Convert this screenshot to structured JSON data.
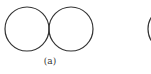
{
  "figure": {
    "panels": [
      {
        "label": "(a)",
        "label_pos": {
          "x": 50,
          "y": 57
        },
        "shapes": [
          {
            "type": "circle",
            "cx": 27,
            "cy": 29,
            "r": 22
          },
          {
            "type": "circle",
            "cx": 71,
            "cy": 29,
            "r": 22
          }
        ]
      },
      {
        "label": "",
        "shapes": [
          {
            "type": "arc-partial",
            "cx": 170,
            "cy": 29,
            "r": 22
          }
        ]
      }
    ],
    "stroke_color": "#333333"
  }
}
